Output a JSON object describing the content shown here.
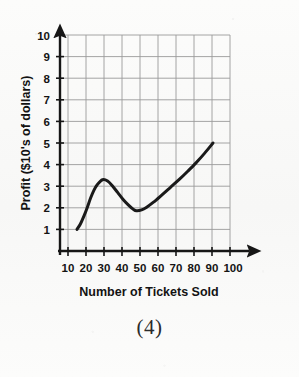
{
  "figure": {
    "caption": "(4)",
    "background_color": "#fbfbfa",
    "curve_color": "#1a1a1a",
    "grid_color": "#9a9a9a",
    "axis_color": "#161616"
  },
  "chart_data": {
    "type": "line",
    "title": "",
    "subtitle": "",
    "xlabel": "Number of Tickets Sold",
    "ylabel": "Profit ($10's of dollars)",
    "xlim": [
      0,
      100
    ],
    "ylim": [
      0,
      10
    ],
    "xticks": [
      10,
      20,
      30,
      40,
      50,
      60,
      70,
      80,
      90,
      100
    ],
    "yticks": [
      1,
      2,
      3,
      4,
      5,
      6,
      7,
      8,
      9,
      10
    ],
    "xtick_labels": [
      "10",
      "20",
      "30",
      "40",
      "50",
      "60",
      "70",
      "80",
      "90",
      "100"
    ],
    "ytick_labels": [
      "1",
      "2",
      "3",
      "4",
      "5",
      "6",
      "7",
      "8",
      "9",
      "10"
    ],
    "grid": true,
    "grid_style": "solid",
    "legend": false,
    "legend_position": "none",
    "axis_arrows": [
      "x-right",
      "y-top"
    ],
    "series": [
      {
        "name": "Profit curve",
        "color": "#1a1a1a",
        "line_width": 3,
        "marker": "none",
        "x": [
          10,
          12,
          14,
          16,
          18,
          20,
          22,
          25,
          28,
          31,
          34,
          37,
          40,
          43,
          45,
          48,
          51,
          55,
          60,
          65,
          70,
          75,
          80,
          85,
          90
        ],
        "y": [
          1.0,
          1.25,
          1.6,
          2.0,
          2.45,
          2.82,
          3.08,
          3.3,
          3.24,
          3.0,
          2.7,
          2.4,
          2.15,
          1.94,
          1.86,
          1.9,
          2.03,
          2.26,
          2.6,
          2.95,
          3.3,
          3.68,
          4.08,
          4.52,
          5.0
        ]
      }
    ],
    "annotations": [
      {
        "label": "start point",
        "x": 10,
        "y": 1.0
      },
      {
        "label": "local maximum",
        "x": 25,
        "y": 3.3
      },
      {
        "label": "local minimum",
        "x": 45,
        "y": 1.85
      },
      {
        "label": "end point",
        "x": 90,
        "y": 5.0
      }
    ]
  }
}
